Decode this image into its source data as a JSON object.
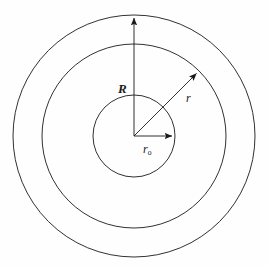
{
  "figure": {
    "kind": "concentric-circles-diagram",
    "background_color": "#fefefe",
    "stroke_color": "#1a1a1a",
    "canvas": {
      "width": 268,
      "height": 266
    },
    "center": {
      "x": 134,
      "y": 136
    }
  },
  "circles": [
    {
      "name": "outer-circle",
      "radius": 121,
      "label": ""
    },
    {
      "name": "middle-circle",
      "radius": 92,
      "label": ""
    },
    {
      "name": "inner-circle",
      "radius": 41,
      "label": ""
    }
  ],
  "arrows": [
    {
      "name": "radius-R-arrow",
      "label": "R",
      "label_subscript": "",
      "direction": "up",
      "angle_deg": 90,
      "length": 121,
      "tip": {
        "x": 134,
        "y": 15
      }
    },
    {
      "name": "radius-r-arrow",
      "label": "r",
      "label_subscript": "",
      "direction": "up-right",
      "angle_deg": 45,
      "length": 92,
      "tip": {
        "x": 199,
        "y": 71
      }
    },
    {
      "name": "radius-r0-arrow",
      "label": "r",
      "label_subscript": "o",
      "direction": "right",
      "angle_deg": 0,
      "length": 41,
      "tip": {
        "x": 175,
        "y": 136
      }
    }
  ],
  "labels": {
    "outer_radius": "R",
    "mid_radius": "r",
    "inner_radius": "r",
    "inner_radius_subscript": "o"
  }
}
